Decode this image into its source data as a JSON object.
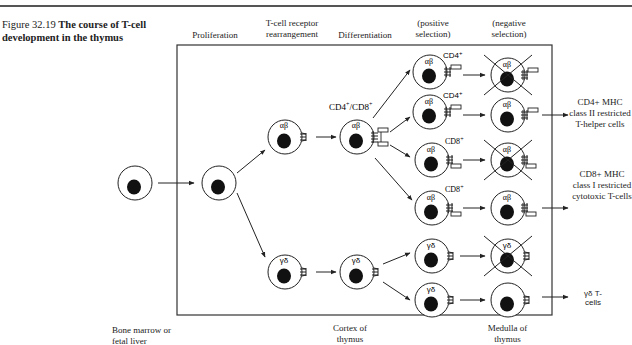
{
  "figure": {
    "number": "Figure 32.19",
    "title": "The course of T-cell development in the thymus"
  },
  "stage_headers": [
    {
      "id": "proliferation",
      "label": "Proliferation"
    },
    {
      "id": "rearrangement",
      "label": "T-cell receptor rearrangement"
    },
    {
      "id": "differentiation",
      "label": "Differentiation"
    },
    {
      "id": "positive",
      "label": "(positive selection)"
    },
    {
      "id": "negative",
      "label": "(negative selection)"
    }
  ],
  "location_labels": {
    "bone_marrow": "Bone marrow or fetal liver",
    "cortex": "Cortex of thymus",
    "medulla": "Medulla of thymus"
  },
  "cell_labels": {
    "ab": "αβ",
    "gd": "γδ",
    "cd4cd8": "CD4+/CD8+",
    "cd4": "CD4+",
    "cd8": "CD8+"
  },
  "outcomes": {
    "cd4": "CD4+ MHC class II restricted T-helper cells",
    "cd8": "CD8+ MHC class I restricted cytotoxic T-cells",
    "gd": "γδ T-cells"
  },
  "positive_selection_rows": [
    {
      "type": "αβ",
      "marker": "CD4+",
      "negative_deleted": true
    },
    {
      "type": "αβ",
      "marker": "CD4+",
      "negative_deleted": false
    },
    {
      "type": "αβ",
      "marker": "CD8+",
      "negative_deleted": true
    },
    {
      "type": "αβ",
      "marker": "CD8+",
      "negative_deleted": false
    },
    {
      "type": "γδ",
      "marker": "",
      "negative_deleted": true
    },
    {
      "type": "γδ",
      "marker": "",
      "negative_deleted": false
    }
  ]
}
